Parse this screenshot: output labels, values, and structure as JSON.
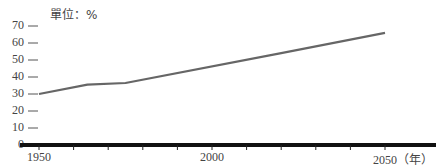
{
  "chart_data": {
    "type": "line",
    "title": "",
    "unit_label": "單位：%",
    "xlabel": "（年）",
    "ylabel": "%",
    "ylim": [
      0,
      70
    ],
    "xlim": [
      1950,
      2050
    ],
    "yticks": [
      "0",
      "10",
      "20",
      "30",
      "40",
      "50",
      "60",
      "70"
    ],
    "xtick_labels": [
      "1950",
      "2000",
      "2050（年）"
    ],
    "xtick_minor_interval": 10,
    "grid": false,
    "legend": null,
    "series": [
      {
        "name": "",
        "color": "#666666",
        "x": [
          1950,
          1964,
          1975,
          2020,
          2050
        ],
        "values": [
          30,
          35.5,
          36.5,
          54,
          66
        ]
      }
    ]
  }
}
